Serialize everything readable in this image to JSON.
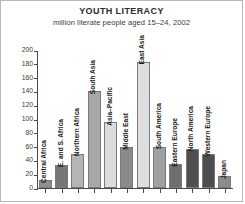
{
  "chart": {
    "title": "YOUTH LITERACY",
    "subtitle": "million literate people aged 15–24, 2002"
  },
  "chart_data": {
    "type": "bar",
    "title": "YOUTH LITERACY",
    "subtitle": "million literate people aged 15–24, 2002",
    "xlabel": "",
    "ylabel": "million literate people aged 15–24",
    "ylim": [
      0,
      200
    ],
    "yticks": [
      0,
      20,
      40,
      60,
      80,
      100,
      120,
      140,
      160,
      180,
      200
    ],
    "grid": false,
    "legend": "none",
    "categories": [
      "Central Africa",
      "E. and S. Africa",
      "Northern Africa",
      "South Asia",
      "Asia–Pacific",
      "Middle East",
      "East Asia",
      "South America",
      "Eastern Europe",
      "North America",
      "Western Europe",
      "Japan"
    ],
    "values": [
      12,
      34,
      50,
      140,
      95,
      60,
      183,
      60,
      35,
      57,
      50,
      17
    ],
    "bar_colors": [
      "#8f8f8f",
      "#777777",
      "#b5b5b5",
      "#a8a8a8",
      "#dcdcdc",
      "#8a8a8a",
      "#dedede",
      "#a0a0a0",
      "#6e6e6e",
      "#505050",
      "#4d4d4d",
      "#8c8c8c"
    ]
  }
}
